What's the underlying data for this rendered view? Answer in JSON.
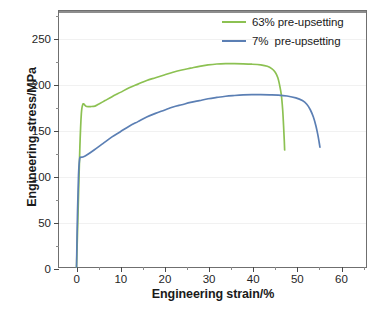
{
  "chart_data": {
    "type": "line",
    "title": "",
    "xlabel": "Engineering strain/%",
    "ylabel": "Engineering stress/MPa",
    "xlim": [
      -4,
      66
    ],
    "ylim": [
      0,
      280
    ],
    "xticks": [
      0,
      10,
      20,
      30,
      40,
      50,
      60
    ],
    "xtick_labels": [
      "0",
      "10",
      "20",
      "30",
      "40",
      "50",
      "60"
    ],
    "yticks": [
      0,
      50,
      100,
      150,
      200,
      250
    ],
    "ytick_labels": [
      "0",
      "50",
      "100",
      "150",
      "200",
      "250"
    ],
    "x_minor_step": 5,
    "y_minor_step": 25,
    "grid": "faint-horizontal",
    "legend_position": "top-right",
    "series": [
      {
        "name": "63% pre-upsetting",
        "color": "#8cc152",
        "points": [
          [
            0.0,
            0
          ],
          [
            0.35,
            60
          ],
          [
            0.75,
            130
          ],
          [
            1.1,
            168
          ],
          [
            1.45,
            178
          ],
          [
            1.9,
            177
          ],
          [
            2.3,
            175.5
          ],
          [
            3.2,
            175.5
          ],
          [
            4.2,
            176
          ],
          [
            5.0,
            178
          ],
          [
            6.5,
            182
          ],
          [
            8.0,
            186
          ],
          [
            10.0,
            191
          ],
          [
            12.0,
            196
          ],
          [
            14.0,
            200
          ],
          [
            16.0,
            204
          ],
          [
            18.0,
            207
          ],
          [
            20.0,
            210
          ],
          [
            22.0,
            213
          ],
          [
            24.0,
            215.5
          ],
          [
            26.0,
            217.5
          ],
          [
            28.0,
            219.5
          ],
          [
            30.0,
            221
          ],
          [
            32.0,
            222
          ],
          [
            34.0,
            222.4
          ],
          [
            36.0,
            222.4
          ],
          [
            38.0,
            222.2
          ],
          [
            40.0,
            221.8
          ],
          [
            42.0,
            221
          ],
          [
            43.5,
            219.5
          ],
          [
            44.5,
            217
          ],
          [
            45.3,
            213
          ],
          [
            45.9,
            207
          ],
          [
            46.3,
            199
          ],
          [
            46.7,
            188
          ],
          [
            47.0,
            172
          ],
          [
            47.2,
            155
          ],
          [
            47.35,
            140
          ],
          [
            47.45,
            128
          ]
        ]
      },
      {
        "name": "7%  pre-upsetting",
        "color": "#5b7fb4",
        "points": [
          [
            0.0,
            0
          ],
          [
            0.2,
            55
          ],
          [
            0.45,
            100
          ],
          [
            0.7,
            118
          ],
          [
            1.0,
            120
          ],
          [
            1.6,
            120.5
          ],
          [
            2.5,
            123
          ],
          [
            4.0,
            128
          ],
          [
            6.0,
            135
          ],
          [
            8.0,
            142
          ],
          [
            10.0,
            148
          ],
          [
            12.0,
            154
          ],
          [
            14.0,
            159
          ],
          [
            16.0,
            164
          ],
          [
            18.0,
            168
          ],
          [
            20.0,
            171.5
          ],
          [
            22.0,
            175
          ],
          [
            24.0,
            177.5
          ],
          [
            26.0,
            180
          ],
          [
            28.0,
            182
          ],
          [
            30.0,
            184
          ],
          [
            32.0,
            185.5
          ],
          [
            34.0,
            186.8
          ],
          [
            36.0,
            187.6
          ],
          [
            38.0,
            188.2
          ],
          [
            40.0,
            188.5
          ],
          [
            42.0,
            188.5
          ],
          [
            44.0,
            188.3
          ],
          [
            46.0,
            188
          ],
          [
            48.0,
            187
          ],
          [
            50.0,
            185
          ],
          [
            51.5,
            182
          ],
          [
            52.5,
            178
          ],
          [
            53.3,
            172
          ],
          [
            54.0,
            164
          ],
          [
            54.6,
            154
          ],
          [
            55.0,
            145
          ],
          [
            55.3,
            137
          ],
          [
            55.5,
            131
          ]
        ]
      }
    ],
    "annotations": []
  },
  "legend": {
    "items": [
      {
        "label": "63% pre-upsetting",
        "color": "#8cc152"
      },
      {
        "label": "7%  pre-upsetting",
        "color": "#5b7fb4"
      }
    ]
  },
  "caption_sliver": ""
}
